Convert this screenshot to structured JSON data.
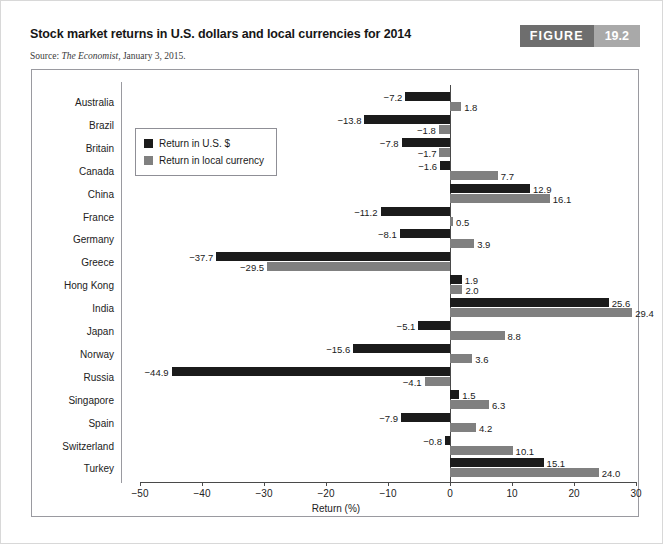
{
  "header": {
    "title": "Stock market returns in U.S. dollars and local currencies for 2014",
    "source_prefix": "Source: ",
    "source_italic": "The Economist",
    "source_suffix": ", January 3, 2015.",
    "figure_word": "FIGURE",
    "figure_number": "19.2"
  },
  "legend": {
    "items": [
      {
        "label": "Return in U.S. $",
        "color": "#1b1b1b",
        "key": "usd"
      },
      {
        "label": "Return in local currency",
        "color": "#808080",
        "key": "local"
      }
    ]
  },
  "colors": {
    "usd_bar": "#1b1b1b",
    "local_bar": "#808080",
    "frame": "#9a9aa0",
    "badge_dark": "#6e6e6e",
    "badge_light": "#a9a9a9"
  },
  "chart_data": {
    "type": "bar",
    "orientation": "horizontal",
    "title": "Stock market returns in U.S. dollars and local currencies for 2014",
    "xlabel": "Return (%)",
    "ylabel": "",
    "xlim": [
      -50,
      30
    ],
    "xticks": [
      -50,
      -40,
      -30,
      -20,
      -10,
      0,
      10,
      20,
      30
    ],
    "xticklabels": [
      "−50",
      "−40",
      "−30",
      "−20",
      "−10",
      "0",
      "10",
      "20",
      "30"
    ],
    "grid": false,
    "legend_position": "upper left (inside plot)",
    "categories": [
      "Australia",
      "Brazil",
      "Britain",
      "Canada",
      "China",
      "France",
      "Germany",
      "Greece",
      "Hong Kong",
      "India",
      "Japan",
      "Norway",
      "Russia",
      "Singapore",
      "Spain",
      "Switzerland",
      "Turkey"
    ],
    "series": [
      {
        "name": "Return in U.S. $",
        "color": "#1b1b1b",
        "values": [
          -7.2,
          -13.8,
          -7.8,
          -1.6,
          12.9,
          -11.2,
          -8.1,
          -37.7,
          1.9,
          25.6,
          -5.1,
          -15.6,
          -44.9,
          1.5,
          -7.9,
          -0.8,
          15.1
        ],
        "labels": [
          "−7.2",
          "−13.8",
          "−7.8",
          "−1.6",
          "12.9",
          "−11.2",
          "−8.1",
          "−37.7",
          "1.9",
          "25.6",
          "−5.1",
          "−15.6",
          "−44.9",
          "1.5",
          "−7.9",
          "−0.8",
          "15.1"
        ]
      },
      {
        "name": "Return in local currency",
        "color": "#808080",
        "values": [
          1.8,
          -1.8,
          -1.7,
          7.7,
          16.1,
          0.5,
          3.9,
          -29.5,
          2.0,
          29.4,
          8.8,
          3.6,
          -4.1,
          6.3,
          4.2,
          10.1,
          24.0
        ],
        "labels": [
          "1.8",
          "−1.8",
          "−1.7",
          "7.7",
          "16.1",
          "0.5",
          "3.9",
          "−29.5",
          "2.0",
          "29.4",
          "8.8",
          "3.6",
          "−4.1",
          "6.3",
          "4.2",
          "10.1",
          "24.0"
        ]
      }
    ]
  }
}
